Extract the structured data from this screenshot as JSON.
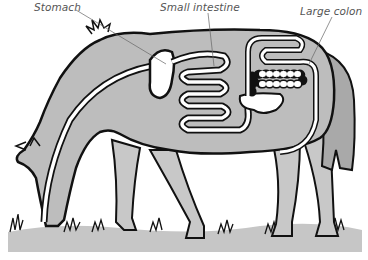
{
  "diagram": {
    "labels": [
      {
        "id": "stomach",
        "text": "Stomach",
        "x": 34,
        "y": 1
      },
      {
        "id": "small-intestine",
        "text": "Small intestine",
        "x": 160,
        "y": 1
      },
      {
        "id": "large-colon",
        "text": "Large colon",
        "x": 312,
        "y": 5
      }
    ],
    "colors": {
      "body_fill": "#bdbdbd",
      "ground_fill": "#c4c4c4",
      "outline": "#111111",
      "organ_fill": "#ffffff",
      "leader_line": "#666666",
      "label_text": "#555555"
    }
  }
}
